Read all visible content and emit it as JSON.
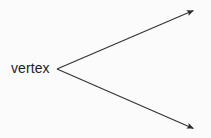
{
  "figure": {
    "name": "angle-with-vertex-diagram",
    "background_color": "#fbfbfb",
    "stroke_color": "#333333",
    "text_color": "#1d1d1d",
    "width": 211,
    "height": 138,
    "labels": {
      "vertex": "vertex"
    },
    "geometry": {
      "vertex_point": {
        "x": 57,
        "y": 69
      },
      "rays": [
        {
          "name": "upper-ray",
          "from": {
            "x": 57,
            "y": 69
          },
          "to": {
            "x": 197,
            "y": 9
          },
          "arrowhead": "solid-triangle"
        },
        {
          "name": "lower-ray",
          "from": {
            "x": 57,
            "y": 69
          },
          "to": {
            "x": 197,
            "y": 130
          },
          "arrowhead": "solid-triangle"
        }
      ]
    }
  }
}
